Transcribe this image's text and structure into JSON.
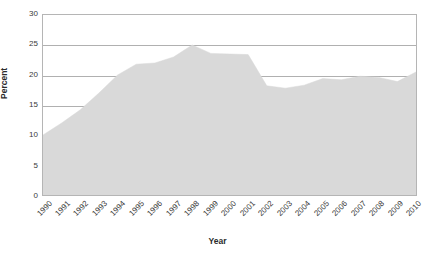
{
  "chart_data": {
    "type": "area",
    "title": "",
    "xlabel": "Year",
    "ylabel": "Percent",
    "categories": [
      "1990",
      "1991",
      "1992",
      "1993",
      "1994",
      "1995",
      "1996",
      "1997",
      "1998",
      "1999",
      "2000",
      "2001",
      "2002",
      "2003",
      "2004",
      "2005",
      "2006",
      "2007",
      "2008",
      "2009",
      "2010"
    ],
    "values": [
      10.0,
      12.0,
      14.2,
      17.0,
      20.0,
      21.8,
      22.0,
      23.0,
      25.0,
      23.6,
      23.5,
      23.4,
      18.2,
      17.8,
      18.3,
      19.4,
      19.2,
      19.8,
      19.6,
      18.9,
      20.5
    ],
    "ylim": [
      0,
      30
    ],
    "yticks": [
      0,
      5,
      10,
      15,
      20,
      25,
      30
    ],
    "grid": true,
    "legend": "none",
    "series_color": "#d9d9d9",
    "grid_color": "#b0b0b0",
    "axis_text_color": "#3a3a3a"
  },
  "axes": {
    "y_title": "Percent",
    "x_title": "Year",
    "y_tick_labels": [
      "30",
      "25",
      "20",
      "15",
      "10",
      "5",
      "0"
    ],
    "x_tick_labels": [
      "1990",
      "1991",
      "1992",
      "1993",
      "1994",
      "1995",
      "1996",
      "1997",
      "1998",
      "1999",
      "2000",
      "2001",
      "2002",
      "2003",
      "2004",
      "2005",
      "2006",
      "2007",
      "2008",
      "2009",
      "2010"
    ]
  }
}
